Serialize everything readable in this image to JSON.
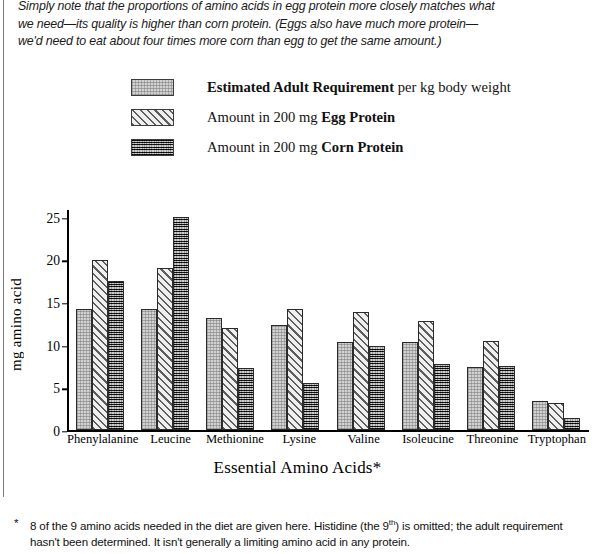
{
  "intro": {
    "line1": "Simply note that the proportions of amino acids in egg protein more closely matches what",
    "line2": "we need—its quality is higher than corn protein.  (Eggs also have much more protein—",
    "line3": "we'd need to eat about four times more corn than egg to get the same amount.)"
  },
  "legend": {
    "items": [
      {
        "swatch": "light-gray-stipple-swatch",
        "bold": "Estimated Adult Requirement",
        "rest": " per kg body weight"
      },
      {
        "swatch": "diagonal-hatch-swatch",
        "lead": "Amount in 200 mg ",
        "bold": "Egg Protein"
      },
      {
        "swatch": "dark-crosshatch-swatch",
        "lead": "Amount in 200 mg ",
        "bold": "Corn Protein"
      }
    ]
  },
  "axes": {
    "ylabel": "mg amino acid",
    "xlabel": "Essential Amino Acids*",
    "yticks": [
      "0",
      "5",
      "10",
      "15",
      "20",
      "25"
    ]
  },
  "footnote": {
    "star": "*",
    "part1": "8 of the 9 amino acids needed in the diet are given here.  Histidine (the 9",
    "sup": "th",
    "part2": ") is omitted; the adult requirement hasn't been determined. It isn't generally a limiting amino acid in any protein."
  },
  "colors": {
    "requirement": "#d2d2d2",
    "egg": "#efefef",
    "corn": "#6f6f6f",
    "axis": "#000000",
    "text": "#000000"
  },
  "chart_data": {
    "type": "bar",
    "title": "",
    "xlabel": "Essential Amino Acids*",
    "ylabel": "mg amino acid",
    "ylim": [
      0,
      26
    ],
    "yticks": [
      0,
      5,
      10,
      15,
      20,
      25
    ],
    "grid": false,
    "legend_position": "above-plot",
    "categories": [
      "Phenylalanine",
      "Leucine",
      "Methionine",
      "Lysine",
      "Valine",
      "Isoleucine",
      "Threonine",
      "Tryptophan"
    ],
    "series": [
      {
        "name": "Estimated Adult Requirement per kg body weight",
        "values": [
          14.2,
          14.2,
          13.2,
          12.4,
          10.3,
          10.4,
          7.4,
          3.5
        ]
      },
      {
        "name": "Amount in 200 mg Egg Protein",
        "values": [
          20.0,
          19.0,
          12.0,
          14.2,
          13.9,
          12.8,
          10.5,
          3.2
        ]
      },
      {
        "name": "Amount in 200 mg Corn Protein",
        "values": [
          17.5,
          25.0,
          7.3,
          5.5,
          9.9,
          7.8,
          7.6,
          1.5
        ]
      }
    ]
  }
}
